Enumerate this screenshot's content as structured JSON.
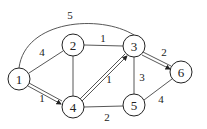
{
  "graph": {
    "nodes": [
      {
        "id": "1",
        "label": "1",
        "x": 19,
        "y": 79
      },
      {
        "id": "2",
        "label": "2",
        "x": 73,
        "y": 45
      },
      {
        "id": "3",
        "label": "3",
        "x": 134,
        "y": 46
      },
      {
        "id": "4",
        "label": "4",
        "x": 73,
        "y": 107
      },
      {
        "id": "5",
        "label": "5",
        "x": 134,
        "y": 105
      },
      {
        "id": "6",
        "label": "6",
        "x": 181,
        "y": 72
      }
    ],
    "edges": [
      {
        "from": "1",
        "to": "3",
        "weight": "5",
        "style": "curve"
      },
      {
        "from": "1",
        "to": "2",
        "weight": "4",
        "style": "single"
      },
      {
        "from": "1",
        "to": "4",
        "weight": "1",
        "style": "double-arrow"
      },
      {
        "from": "2",
        "to": "3",
        "weight": "1",
        "style": "single"
      },
      {
        "from": "2",
        "to": "4",
        "weight": "",
        "style": "single"
      },
      {
        "from": "4",
        "to": "3",
        "weight": "1",
        "style": "double-arrow"
      },
      {
        "from": "3",
        "to": "6",
        "weight": "2",
        "style": "double-arrow"
      },
      {
        "from": "3",
        "to": "5",
        "weight": "3",
        "style": "single"
      },
      {
        "from": "4",
        "to": "5",
        "weight": "2",
        "style": "single"
      },
      {
        "from": "5",
        "to": "6",
        "weight": "4",
        "style": "single"
      }
    ],
    "edge_labels": {
      "e13": "5",
      "e12": "4",
      "e14": "1",
      "e23": "1",
      "e43": "1",
      "e36": "2",
      "e35": "3",
      "e45": "2",
      "e56": "4"
    },
    "node_labels": {
      "n1": "1",
      "n2": "2",
      "n3": "3",
      "n4": "4",
      "n5": "5",
      "n6": "6"
    }
  }
}
